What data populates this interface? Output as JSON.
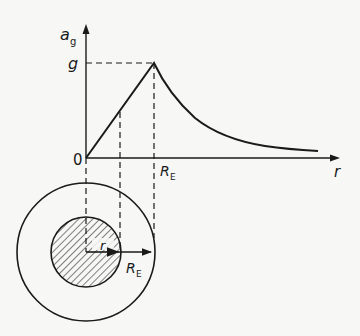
{
  "diagram": {
    "y_axis_label": "a",
    "y_axis_label_sub": "g",
    "y_tick_g": "g",
    "origin_label": "0",
    "x_axis_label": "r",
    "x_tick_RE": "R",
    "x_tick_RE_sub": "E",
    "inner_radius_label": "r",
    "earth_radius_label": "R",
    "earth_radius_label_sub": "E",
    "colors": {
      "ink": "#1a1a1a",
      "background": "#f7f7f5"
    },
    "curve": {
      "inside": "linear increase from 0 at r=0 to g at r=R_E",
      "outside": "decrease proportional to 1/r^2 beyond R_E"
    }
  }
}
